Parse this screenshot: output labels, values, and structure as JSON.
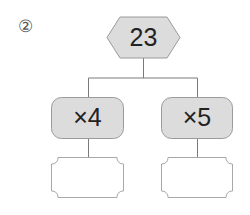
{
  "problem_number": "②",
  "root": {
    "value": "23"
  },
  "operations": [
    {
      "label": "×4",
      "answer": ""
    },
    {
      "label": "×5",
      "answer": ""
    }
  ],
  "colors": {
    "node_fill": "#dcdcdc",
    "node_stroke": "#9a9a9a",
    "line": "#7a7a7a",
    "answer_stroke": "#a8a8a8"
  }
}
